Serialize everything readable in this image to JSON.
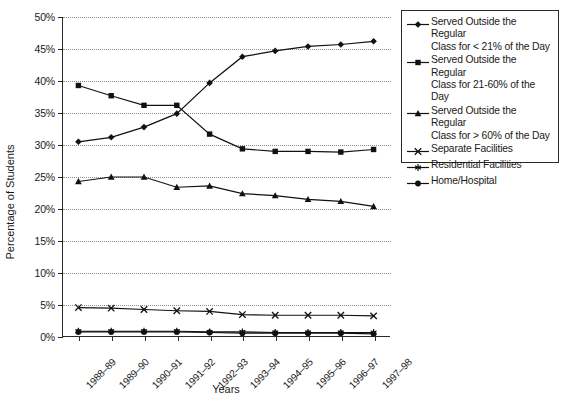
{
  "chart_data": {
    "type": "line",
    "title": "",
    "xlabel": "Years",
    "ylabel": "Percentage of Students",
    "categories": [
      "1988–89",
      "1989–90",
      "1990–91",
      "1991–92",
      "1992–93",
      "1993–94",
      "1994–95",
      "1995–96",
      "1996–97",
      "1997–98"
    ],
    "ylim": [
      0,
      50
    ],
    "ytick_labels": [
      "0%",
      "5%",
      "10%",
      "15%",
      "20%",
      "25%",
      "30%",
      "35%",
      "40%",
      "45%",
      "50%"
    ],
    "ytick_values": [
      0,
      5,
      10,
      15,
      20,
      25,
      30,
      35,
      40,
      45,
      50
    ],
    "grid": true,
    "legend_position": "right",
    "series": [
      {
        "name": "Served Outside the Regular Class for < 21% of the Day",
        "name_line1": "Served Outside the Regular",
        "name_line2": "Class for < 21% of the Day",
        "marker": "diamond",
        "values": [
          30.5,
          31.2,
          32.8,
          34.9,
          39.7,
          43.8,
          44.7,
          45.4,
          45.7,
          46.2
        ]
      },
      {
        "name": "Served Outside the Regular Class for 21-60% of the Day",
        "name_line1": "Served Outside the Regular",
        "name_line2": "Class for 21-60% of the Day",
        "marker": "square",
        "values": [
          39.3,
          37.7,
          36.2,
          36.2,
          31.7,
          29.4,
          29.0,
          29.0,
          28.9,
          29.3
        ]
      },
      {
        "name": "Served Outside the Regular Class for > 60% of the Day",
        "name_line1": "Served Outside the Regular",
        "name_line2": "Class for > 60% of the Day",
        "marker": "triangle",
        "values": [
          24.3,
          25.0,
          25.0,
          23.4,
          23.6,
          22.4,
          22.1,
          21.5,
          21.2,
          20.4
        ]
      },
      {
        "name": "Separate Facilities",
        "name_line1": "Separate Facilities",
        "name_line2": "",
        "marker": "x",
        "values": [
          4.6,
          4.5,
          4.3,
          4.1,
          4.0,
          3.5,
          3.4,
          3.4,
          3.4,
          3.3
        ]
      },
      {
        "name": "Residential Facilities",
        "name_line1": "Residential Facilities",
        "name_line2": "",
        "marker": "asterisk",
        "values": [
          0.9,
          0.9,
          0.9,
          0.9,
          0.8,
          0.8,
          0.7,
          0.7,
          0.7,
          0.7
        ]
      },
      {
        "name": "Home/Hospital",
        "name_line1": "Home/Hospital",
        "name_line2": "",
        "marker": "circle",
        "values": [
          0.8,
          0.8,
          0.8,
          0.8,
          0.7,
          0.6,
          0.6,
          0.6,
          0.6,
          0.5
        ]
      }
    ],
    "colors": {
      "line": "#111111",
      "grid": "#8c8c8c",
      "axis": "#2a2a2a",
      "background": "#ffffff"
    }
  }
}
